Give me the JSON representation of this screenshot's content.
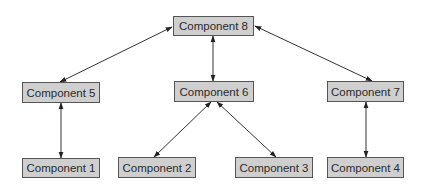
{
  "diagram": {
    "type": "component-hierarchy",
    "colors": {
      "node_fill": "#cfcfcf",
      "node_border": "#555555",
      "text": "#2b2b2b",
      "edge": "#333333"
    },
    "nodes": [
      {
        "id": "c8",
        "label": "Component 8",
        "x": 173,
        "y": 16,
        "w": 81,
        "h": 20
      },
      {
        "id": "c5",
        "label": "Component 5",
        "x": 22,
        "y": 82,
        "w": 78,
        "h": 21
      },
      {
        "id": "c6",
        "label": "Component 6",
        "x": 174,
        "y": 81,
        "w": 80,
        "h": 21
      },
      {
        "id": "c7",
        "label": "Component 7",
        "x": 327,
        "y": 81,
        "w": 77,
        "h": 21
      },
      {
        "id": "c1",
        "label": "Component 1",
        "x": 22,
        "y": 158,
        "w": 78,
        "h": 20
      },
      {
        "id": "c2",
        "label": "Component 2",
        "x": 118,
        "y": 157,
        "w": 78,
        "h": 21
      },
      {
        "id": "c3",
        "label": "Component 3",
        "x": 235,
        "y": 157,
        "w": 78,
        "h": 21
      },
      {
        "id": "c4",
        "label": "Component 4",
        "x": 327,
        "y": 157,
        "w": 77,
        "h": 21
      }
    ],
    "edges": [
      {
        "from": "c8",
        "to": "c5",
        "bidirectional": true
      },
      {
        "from": "c8",
        "to": "c6",
        "bidirectional": true
      },
      {
        "from": "c8",
        "to": "c7",
        "bidirectional": true
      },
      {
        "from": "c5",
        "to": "c1",
        "bidirectional": true
      },
      {
        "from": "c6",
        "to": "c2",
        "bidirectional": true
      },
      {
        "from": "c6",
        "to": "c3",
        "bidirectional": true
      },
      {
        "from": "c7",
        "to": "c4",
        "bidirectional": true
      }
    ]
  }
}
